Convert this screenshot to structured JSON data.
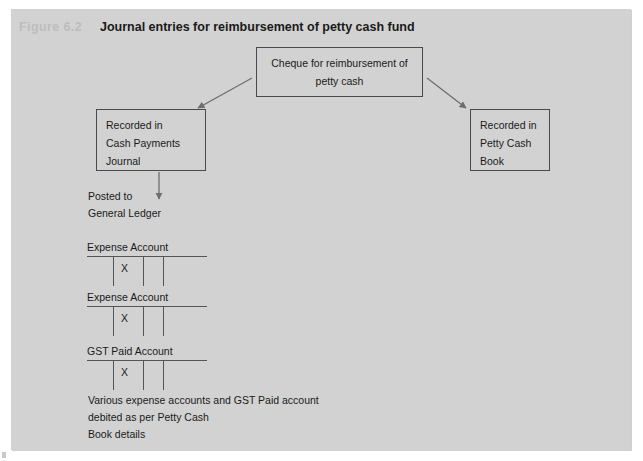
{
  "figure": {
    "label": "Figure 6.2",
    "title": "Journal entries for reimbursement of petty cash fund"
  },
  "colors": {
    "panel_background": "#d2d2d2",
    "page_background": "#ffffff",
    "box_border": "#4a4a4a",
    "text": "#1a1a1a",
    "label_grey": "#bdbdbd",
    "rule": "#555555",
    "arrow": "#6e6e6e"
  },
  "boxes": {
    "cheque": {
      "lines": [
        "Cheque for reimbursement of",
        "petty cash"
      ]
    },
    "cash_payments_journal": {
      "lines": [
        "Recorded in",
        "Cash Payments",
        "Journal"
      ]
    },
    "petty_cash_book": {
      "lines": [
        "Recorded in",
        "Petty Cash",
        "Book"
      ]
    }
  },
  "posted_to": {
    "lines": [
      "Posted to",
      "General Ledger"
    ]
  },
  "t_accounts": [
    {
      "label": "Expense Account",
      "entry": "X"
    },
    {
      "label": "Expense Account",
      "entry": "X"
    },
    {
      "label": "GST Paid Account",
      "entry": "X"
    }
  ],
  "footnote": {
    "lines": [
      "Various expense accounts and GST Paid account",
      "debited as per Petty Cash",
      "Book details"
    ]
  },
  "icons": {
    "arrow_left_branch": "arrow-down-left-icon",
    "arrow_right_branch": "arrow-down-right-icon",
    "arrow_posting": "arrow-down-icon"
  }
}
